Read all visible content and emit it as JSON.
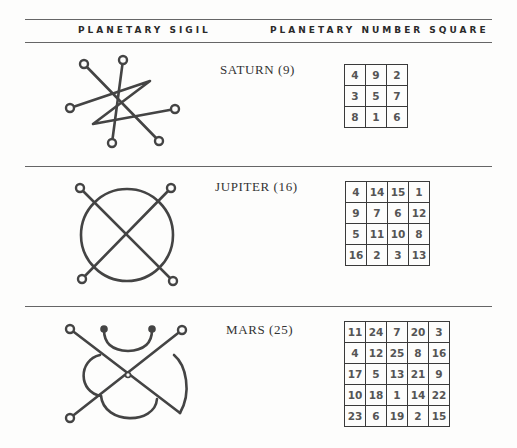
{
  "header": {
    "col1": "PLANETARY SIGIL",
    "col2": "PLANETARY NUMBER SQUARE"
  },
  "planets": [
    {
      "name": "SATURN (9)",
      "sigil": "saturn-sigil-icon",
      "square": [
        [
          4,
          9,
          2
        ],
        [
          3,
          5,
          7
        ],
        [
          8,
          1,
          6
        ]
      ]
    },
    {
      "name": "JUPITER (16)",
      "sigil": "jupiter-sigil-icon",
      "square": [
        [
          4,
          14,
          15,
          1
        ],
        [
          9,
          7,
          6,
          12
        ],
        [
          5,
          11,
          10,
          8
        ],
        [
          16,
          2,
          3,
          13
        ]
      ]
    },
    {
      "name": "MARS (25)",
      "sigil": "mars-sigil-icon",
      "square": [
        [
          11,
          24,
          7,
          20,
          3
        ],
        [
          4,
          12,
          25,
          8,
          16
        ],
        [
          17,
          5,
          13,
          21,
          9
        ],
        [
          10,
          18,
          1,
          14,
          22
        ],
        [
          23,
          6,
          19,
          2,
          15
        ]
      ]
    }
  ]
}
